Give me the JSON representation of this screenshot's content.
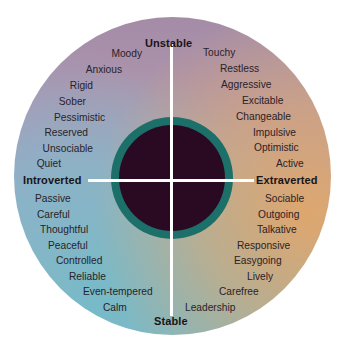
{
  "diagram": {
    "axes": {
      "top": "Unstable",
      "bottom": "Stable",
      "left": "Introverted",
      "right": "Extraverted"
    },
    "quadrants": {
      "unstable_introverted": [
        "Moody",
        "Anxious",
        "Rigid",
        "Sober",
        "Pessimistic",
        "Reserved",
        "Unsociable",
        "Quiet"
      ],
      "unstable_extraverted": [
        "Touchy",
        "Restless",
        "Aggressive",
        "Excitable",
        "Changeable",
        "Impulsive",
        "Optimistic",
        "Active"
      ],
      "stable_introverted": [
        "Passive",
        "Careful",
        "Thoughtful",
        "Peaceful",
        "Controlled",
        "Reliable",
        "Even-tempered",
        "Calm"
      ],
      "stable_extraverted": [
        "Sociable",
        "Outgoing",
        "Talkative",
        "Responsive",
        "Easygoing",
        "Lively",
        "Carefree",
        "Leadership"
      ]
    },
    "colors": {
      "ring": "#1d6f6a",
      "core": "#2a0a22",
      "upper": "#a48ca8",
      "right": "#e1a669",
      "lower": "#8fb6c4",
      "lines": "#ffffff"
    }
  }
}
